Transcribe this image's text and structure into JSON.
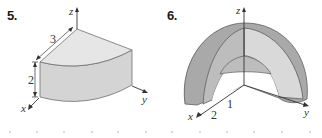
{
  "figures": [
    {
      "number": "5.",
      "shape": "quarter-cylinder",
      "axes": {
        "x": "x",
        "y": "y",
        "z": "z"
      },
      "dimensions": {
        "radius": "3",
        "height": "2"
      },
      "colors": {
        "top_face": "#e6e6e6",
        "side_face": "#d4d4d4",
        "edge": "#6e6e6e",
        "axis": "#333333"
      }
    },
    {
      "number": "6.",
      "shape": "quarter-spherical-shell",
      "axes": {
        "x": "x",
        "y": "y",
        "z": "z"
      },
      "dimensions": {
        "inner_radius": "1",
        "outer_radius": "2"
      },
      "colors": {
        "outer_surface": "#a9a9a9",
        "cut_face": "#d9d9d9",
        "inner_surface": "#bdbdbd",
        "edge": "#5e5e5e",
        "axis": "#333333"
      }
    }
  ]
}
